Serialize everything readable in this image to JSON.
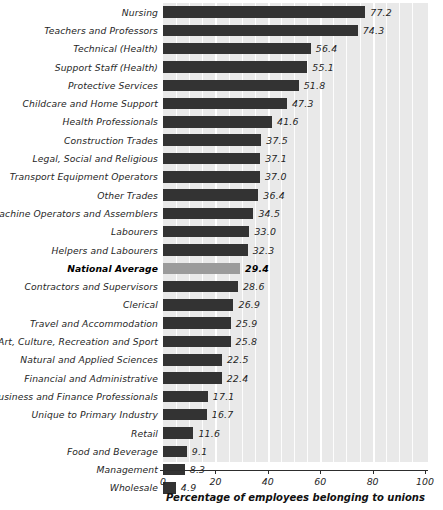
{
  "chart_data": {
    "type": "bar",
    "orientation": "horizontal",
    "title": "",
    "xlabel": "Percentage of employees belonging to unions",
    "ylabel": "",
    "xlim": [
      0,
      100
    ],
    "xticks": [
      0,
      20,
      40,
      60,
      80,
      100
    ],
    "xtick_labels": [
      "0",
      "20",
      "40",
      "60",
      "80",
      "100"
    ],
    "grid": true,
    "grid_axis": "x",
    "legend": "none",
    "bar_color": "#333333",
    "highlight_color": "#9b9b9b",
    "plot_background": "#e9e9e9",
    "highlight_category": "National Average",
    "categories": [
      "Nursing",
      "Teachers and Professors",
      "Technical (Health)",
      "Support Staff (Health)",
      "Protective Services",
      "Childcare and Home Support",
      "Health Professionals",
      "Construction Trades",
      "Legal, Social and Religious",
      "Transport Equipment Operators",
      "Other Trades",
      "Machine Operators and Assemblers",
      "Labourers",
      "Helpers and Labourers",
      "National Average",
      "Contractors and Supervisors",
      "Clerical",
      "Travel and Accommodation",
      "Art, Culture, Recreation and Sport",
      "Natural and Applied Sciences",
      "Financial and Administrative",
      "Business and Finance Professionals",
      "Unique to Primary Industry",
      "Retail",
      "Food and Beverage",
      "Management",
      "Wholesale"
    ],
    "values": [
      77.2,
      74.3,
      56.4,
      55.1,
      51.8,
      47.3,
      41.6,
      37.5,
      37.1,
      37.0,
      36.4,
      34.5,
      33.0,
      32.3,
      29.4,
      28.6,
      26.9,
      25.9,
      25.8,
      22.5,
      22.4,
      17.1,
      16.7,
      11.6,
      9.1,
      8.3,
      4.9
    ],
    "value_labels": [
      "77.2",
      "74.3",
      "56.4",
      "55.1",
      "51.8",
      "47.3",
      "41.6",
      "37.5",
      "37.1",
      "37.0",
      "36.4",
      "34.5",
      "33.0",
      "32.3",
      "29.4",
      "28.6",
      "26.9",
      "25.9",
      "25.8",
      "22.5",
      "22.4",
      "17.1",
      "16.7",
      "11.6",
      "9.1",
      "8.3",
      "4.9"
    ]
  }
}
